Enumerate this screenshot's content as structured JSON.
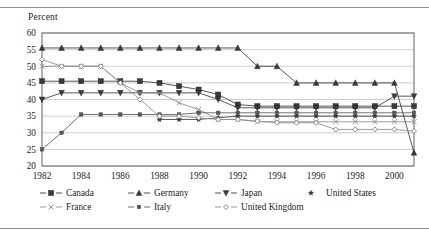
{
  "figure": {
    "y_axis_title": "Percent",
    "rule_color": "#8e8e8e"
  },
  "legend": {
    "entries": [
      {
        "label": "Canada",
        "marker": "filled-square",
        "color": "#3a3a3a",
        "row": 1,
        "x": 40
      },
      {
        "label": "Germany",
        "marker": "filled-triangle-up",
        "color": "#3a3a3a",
        "row": 1,
        "x": 128
      },
      {
        "label": "Japan",
        "marker": "filled-triangle-down",
        "color": "#3a3a3a",
        "row": 1,
        "x": 215
      },
      {
        "label": "United States",
        "marker": "filled-star",
        "color": "#3a3a3a",
        "row": 1,
        "x": 300
      },
      {
        "label": "France",
        "marker": "cross-x",
        "color": "#8a8a8a",
        "row": 2,
        "x": 40
      },
      {
        "label": "Italy",
        "marker": "small-filled-square",
        "color": "#5a5a5a",
        "row": 2,
        "x": 128
      },
      {
        "label": "United Kingdom",
        "marker": "open-diamond",
        "color": "#8a8a8a",
        "row": 2,
        "x": 215
      }
    ]
  },
  "chart_data": {
    "type": "line",
    "title": "",
    "subtitle": "",
    "xlabel": "",
    "ylabel": "Percent",
    "ylim": [
      20,
      60
    ],
    "y_ticks": [
      20,
      25,
      30,
      35,
      40,
      45,
      50,
      55,
      60
    ],
    "xlim": [
      1982,
      2001
    ],
    "x_ticks": [
      1982,
      1984,
      1986,
      1988,
      1990,
      1992,
      1994,
      1996,
      1998,
      2000
    ],
    "x": [
      1982,
      1983,
      1984,
      1985,
      1986,
      1987,
      1988,
      1989,
      1990,
      1991,
      1992,
      1993,
      1994,
      1995,
      1996,
      1997,
      1998,
      1999,
      2000,
      2001
    ],
    "grid": "horizontal",
    "legend_position": "bottom",
    "series": [
      {
        "name": "Canada",
        "marker": "filled-square",
        "color": "#3a3a3a",
        "values": [
          45.5,
          45.5,
          45.5,
          45.5,
          45.5,
          45.5,
          45.0,
          44.0,
          43.0,
          41.5,
          38.5,
          38.0,
          38.0,
          38.0,
          38.0,
          38.0,
          38.0,
          38.0,
          38.0,
          38.0
        ]
      },
      {
        "name": "Germany",
        "marker": "filled-triangle-up",
        "color": "#3a3a3a",
        "values": [
          55.5,
          55.5,
          55.5,
          55.5,
          55.5,
          55.5,
          55.5,
          55.5,
          55.5,
          55.5,
          55.5,
          50.0,
          50.0,
          45.0,
          45.0,
          45.0,
          45.0,
          45.0,
          45.0,
          24.0
        ]
      },
      {
        "name": "Japan",
        "marker": "filled-triangle-down",
        "color": "#3a3a3a",
        "values": [
          40.0,
          42.0,
          42.0,
          42.0,
          42.0,
          42.0,
          42.0,
          42.0,
          42.0,
          40.0,
          37.5,
          37.5,
          37.5,
          37.5,
          37.5,
          37.5,
          37.5,
          37.5,
          41.0,
          41.0
        ]
      },
      {
        "name": "United States",
        "marker": "filled-star",
        "color": "#3a3a3a",
        "values": [
          null,
          null,
          null,
          null,
          null,
          null,
          34.0,
          34.0,
          34.0,
          34.5,
          35.0,
          35.0,
          35.0,
          35.0,
          35.0,
          35.0,
          35.0,
          35.0,
          35.0,
          35.0
        ]
      },
      {
        "name": "France",
        "marker": "cross-x",
        "color": "#8a8a8a",
        "values": [
          50.0,
          50.0,
          50.0,
          50.0,
          45.0,
          42.0,
          42.0,
          39.0,
          37.0,
          34.0,
          34.0,
          33.3,
          33.3,
          33.3,
          33.3,
          33.3,
          33.3,
          33.3,
          33.3,
          33.3
        ]
      },
      {
        "name": "Italy",
        "marker": "small-filled-square",
        "color": "#5a5a5a",
        "values": [
          25.0,
          30.0,
          35.5,
          35.5,
          35.5,
          35.5,
          35.5,
          35.5,
          36.0,
          36.0,
          36.0,
          36.0,
          36.0,
          36.0,
          36.0,
          36.0,
          36.0,
          36.0,
          36.0,
          36.0
        ]
      },
      {
        "name": "United Kingdom",
        "marker": "open-diamond",
        "color": "#8a8a8a",
        "values": [
          52.0,
          50.0,
          50.0,
          50.0,
          45.0,
          40.0,
          35.0,
          35.0,
          34.5,
          34.0,
          34.0,
          33.5,
          33.0,
          33.0,
          33.0,
          31.0,
          31.0,
          31.0,
          31.0,
          30.5
        ]
      }
    ]
  }
}
